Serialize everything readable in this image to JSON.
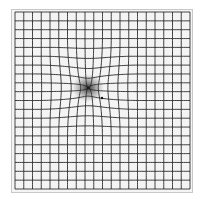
{
  "figure": {
    "kind": "amsler-grid",
    "grid": {
      "columns": 20,
      "rows": 20,
      "left": 15,
      "top": 12,
      "right": 190,
      "bottom": 189,
      "line_color": "#2a2a2a",
      "background": "#f4f4f4"
    },
    "distortion": {
      "center_x": 88,
      "center_y": 88,
      "radius": 55,
      "strength": 14,
      "spot_color": "#1a1a1a"
    }
  }
}
